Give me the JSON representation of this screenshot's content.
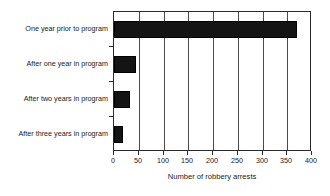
{
  "chart_data": {
    "type": "bar",
    "orientation": "horizontal",
    "title": "",
    "xlabel": "Number of robbery arrests",
    "ylabel": "",
    "xlim": [
      0,
      400
    ],
    "xticks": [
      0,
      50,
      100,
      150,
      200,
      250,
      300,
      350,
      400
    ],
    "grid": true,
    "legend": false,
    "bar_color": "#141414",
    "frame_color": "#2b2b2b",
    "categories": [
      "One year prior to program",
      "After one year in program",
      "After two years in program",
      "After three years in program"
    ],
    "values": [
      370,
      44,
      33,
      19
    ]
  }
}
